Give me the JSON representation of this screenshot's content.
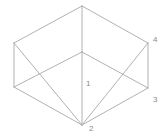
{
  "figure": {
    "type": "line-drawing",
    "background_color": "#ffffff",
    "stroke_color": "#a8a8a8",
    "stroke_width": 0.9,
    "label_color": "#8a8a8a",
    "label_font_size": 8
  },
  "vertices": [
    {
      "id": "top-apex",
      "name": "top-back-corner",
      "x": 82,
      "y": 6,
      "label": ""
    },
    {
      "id": "left-upper",
      "name": "left-top-corner",
      "x": 14,
      "y": 43,
      "label": ""
    },
    {
      "id": "right-upper",
      "name": "right-top-corner",
      "x": 148,
      "y": 43,
      "label": "4"
    },
    {
      "id": "center",
      "name": "near-top-corner",
      "x": 82,
      "y": 52,
      "label": ""
    },
    {
      "id": "left-lower",
      "name": "left-bottom-corner",
      "x": 14,
      "y": 87,
      "label": ""
    },
    {
      "id": "right-lower",
      "name": "right-bottom-corner",
      "x": 148,
      "y": 88,
      "label": "3"
    },
    {
      "id": "bottom-apex",
      "name": "bottom-front-corner",
      "x": 82,
      "y": 125,
      "label": "2"
    },
    {
      "id": "center-lower",
      "name": "near-bottom-corner",
      "x": 82,
      "y": 52,
      "label": "1"
    }
  ],
  "edges": [
    {
      "name": "top-left-edge",
      "x1": 82,
      "y1": 6,
      "x2": 14,
      "y2": 43
    },
    {
      "name": "top-right-edge",
      "x1": 82,
      "y1": 6,
      "x2": 148,
      "y2": 43
    },
    {
      "name": "vertical-back-edge",
      "x1": 82,
      "y1": 6,
      "x2": 82,
      "y2": 52
    },
    {
      "name": "left-vertical-edge",
      "x1": 14,
      "y1": 43,
      "x2": 14,
      "y2": 87
    },
    {
      "name": "right-vertical-edge",
      "x1": 148,
      "y1": 43,
      "x2": 148,
      "y2": 88
    },
    {
      "name": "center-left-upper",
      "x1": 82,
      "y1": 52,
      "x2": 14,
      "y2": 87
    },
    {
      "name": "center-right-upper",
      "x1": 82,
      "y1": 52,
      "x2": 148,
      "y2": 88
    },
    {
      "name": "center-vertical-edge",
      "x1": 82,
      "y1": 52,
      "x2": 82,
      "y2": 125
    },
    {
      "name": "cross-left-down",
      "x1": 14,
      "y1": 43,
      "x2": 82,
      "y2": 125
    },
    {
      "name": "cross-right-down",
      "x1": 148,
      "y1": 43,
      "x2": 82,
      "y2": 125
    },
    {
      "name": "bottom-left-edge",
      "x1": 14,
      "y1": 87,
      "x2": 82,
      "y2": 125
    },
    {
      "name": "bottom-right-edge",
      "x1": 148,
      "y1": 88,
      "x2": 82,
      "y2": 125
    }
  ],
  "labels": [
    {
      "name": "vertex-label-1",
      "text": "1",
      "x": 86,
      "y": 80
    },
    {
      "name": "vertex-label-2",
      "text": "2",
      "x": 89,
      "y": 125
    },
    {
      "name": "vertex-label-3",
      "text": "3",
      "x": 153,
      "y": 96
    },
    {
      "name": "vertex-label-4",
      "text": "4",
      "x": 153,
      "y": 36
    }
  ]
}
